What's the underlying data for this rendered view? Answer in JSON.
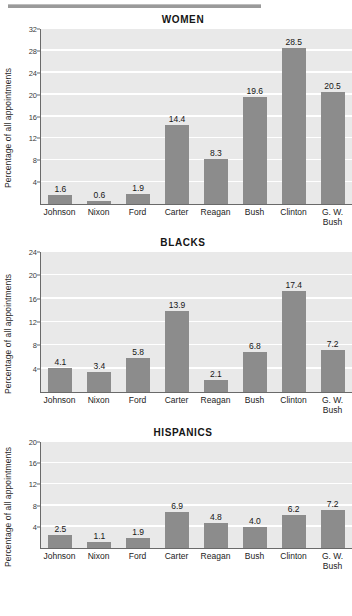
{
  "figure": {
    "rule_present": true,
    "ylabel": "Percentage of all appointments",
    "categories": [
      "Johnson",
      "Nixon",
      "Ford",
      "Carter",
      "Reagan",
      "Bush",
      "Clinton",
      "G. W.\nBush"
    ],
    "colors": {
      "bar": "#8c8c8c",
      "plot_background": "#e9e9e9",
      "gridline": "#ffffff",
      "axis": "#6a6a6a",
      "rule": "#9a9a9a",
      "text": "#1b1b1b"
    }
  },
  "chart_data": [
    {
      "type": "bar",
      "title": "WOMEN",
      "xlabel": "",
      "ylabel": "Percentage of all appointments",
      "categories": [
        "Johnson",
        "Nixon",
        "Ford",
        "Carter",
        "Reagan",
        "Bush",
        "Clinton",
        "G. W.\nBush"
      ],
      "values": [
        1.6,
        0.6,
        1.9,
        14.4,
        8.3,
        19.6,
        28.5,
        20.5
      ],
      "value_labels": [
        "1.6",
        "0.6",
        "1.9",
        "14.4",
        "8.3",
        "19.6",
        "28.5",
        "20.5"
      ],
      "ylim": [
        0,
        32
      ],
      "yticks": [
        4,
        8,
        12,
        16,
        20,
        24,
        28,
        32
      ],
      "ytick_labels": [
        "4",
        "8",
        "12",
        "16",
        "20",
        "24",
        "28",
        "32"
      ],
      "grid": true,
      "legend": "none"
    },
    {
      "type": "bar",
      "title": "BLACKS",
      "xlabel": "",
      "ylabel": "Percentage of all appointments",
      "categories": [
        "Johnson",
        "Nixon",
        "Ford",
        "Carter",
        "Reagan",
        "Bush",
        "Clinton",
        "G. W.\nBush"
      ],
      "values": [
        4.1,
        3.4,
        5.8,
        13.9,
        2.1,
        6.8,
        17.4,
        7.2
      ],
      "value_labels": [
        "4.1",
        "3.4",
        "5.8",
        "13.9",
        "2.1",
        "6.8",
        "17.4",
        "7.2"
      ],
      "ylim": [
        0,
        24
      ],
      "yticks": [
        4,
        8,
        12,
        16,
        20,
        24
      ],
      "ytick_labels": [
        "4",
        "8",
        "12",
        "16",
        "20",
        "24"
      ],
      "grid": true,
      "legend": "none"
    },
    {
      "type": "bar",
      "title": "HISPANICS",
      "xlabel": "",
      "ylabel": "Percentage of all appointments",
      "categories": [
        "Johnson",
        "Nixon",
        "Ford",
        "Carter",
        "Reagan",
        "Bush",
        "Clinton",
        "G. W.\nBush"
      ],
      "values": [
        2.5,
        1.1,
        1.9,
        6.9,
        4.8,
        4.0,
        6.2,
        7.2
      ],
      "value_labels": [
        "2.5",
        "1.1",
        "1.9",
        "6.9",
        "4.8",
        "4.0",
        "6.2",
        "7.2"
      ],
      "ylim": [
        0,
        20
      ],
      "yticks": [
        4,
        8,
        12,
        16,
        20
      ],
      "ytick_labels": [
        "4",
        "8",
        "12",
        "16",
        "20"
      ],
      "grid": true,
      "legend": "none"
    }
  ]
}
